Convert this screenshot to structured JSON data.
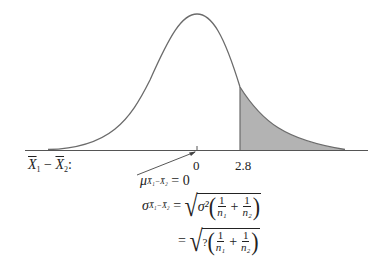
{
  "diagram": {
    "type": "normal-distribution-sampling-difference",
    "curve_color": "#6b6b6b",
    "shade_color": "#b3b3b3",
    "axis_label": "X̄₁ − X̄₂:",
    "axis_label_parts": {
      "x1": "X",
      "sub1": "1",
      "minus": " − ",
      "x2": "X",
      "sub2": "2",
      "colon": ":"
    },
    "ticks": [
      {
        "label": "0"
      },
      {
        "label": "2.8"
      }
    ],
    "shaded_region": "right tail beyond 2.8"
  },
  "equations": {
    "mean": {
      "symbol": "μ",
      "sub": "X̄₁−X̄₂",
      "rhs": "= 0"
    },
    "sigma": {
      "symbol": "σ",
      "sub": "X̄₁−X̄₂",
      "eq": "=",
      "radicand_lead": "σ²",
      "frac1_num": "1",
      "frac1_den": "n₁",
      "plus": "+",
      "frac2_num": "1",
      "frac2_den": "n₂"
    },
    "sigma_line2": {
      "eq": "=",
      "radicand_lead": "?",
      "frac1_num": "1",
      "frac1_den": "n₁",
      "plus": "+",
      "frac2_num": "1",
      "frac2_den": "n₂"
    }
  }
}
